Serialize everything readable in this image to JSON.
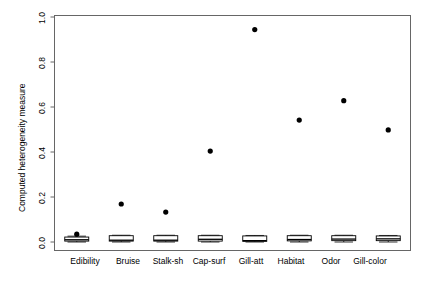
{
  "chart_data": {
    "type": "scatter",
    "title": "",
    "xlabel": "",
    "ylabel": "Computed heterogeneity measure",
    "categories": [
      "Edibility",
      "Bruise",
      "Stalk-sh",
      "Cap-surf",
      "Gill-att",
      "Habitat",
      "Odor",
      "Gill-color"
    ],
    "ylim": [
      0.0,
      1.0
    ],
    "ytick_labels": [
      "0.0",
      "0.2",
      "0.4",
      "0.6",
      "0.8",
      "1.0"
    ],
    "ytick_values": [
      0.0,
      0.2,
      0.4,
      0.6,
      0.8,
      1.0
    ],
    "grid": false,
    "legend": "none",
    "series": [
      {
        "name": "Computed heterogeneity measure",
        "marker": "filled-circle",
        "color": "#000000",
        "values": [
          0.035,
          0.169,
          0.133,
          0.404,
          0.944,
          0.542,
          0.628,
          0.498
        ]
      }
    ],
    "boxplots": [
      {
        "category": "Edibility",
        "min": 0.0,
        "q1": 0.004,
        "median": 0.01,
        "q3": 0.022,
        "max": 0.026
      },
      {
        "category": "Bruise",
        "min": 0.0,
        "q1": 0.004,
        "median": 0.008,
        "q3": 0.028,
        "max": 0.03
      },
      {
        "category": "Stalk-sh",
        "min": 0.0,
        "q1": 0.004,
        "median": 0.008,
        "q3": 0.028,
        "max": 0.03
      },
      {
        "category": "Cap-surf",
        "min": 0.0,
        "q1": 0.004,
        "median": 0.012,
        "q3": 0.028,
        "max": 0.03
      },
      {
        "category": "Gill-att",
        "min": 0.0,
        "q1": 0.003,
        "median": 0.006,
        "q3": 0.027,
        "max": 0.029
      },
      {
        "category": "Habitat",
        "min": 0.0,
        "q1": 0.005,
        "median": 0.011,
        "q3": 0.028,
        "max": 0.03
      },
      {
        "category": "Odor",
        "min": 0.0,
        "q1": 0.006,
        "median": 0.013,
        "q3": 0.028,
        "max": 0.03
      },
      {
        "category": "Gill-color",
        "min": 0.0,
        "q1": 0.006,
        "median": 0.014,
        "q3": 0.027,
        "max": 0.029
      }
    ]
  },
  "axes": {
    "y_title": "Computed heterogeneity measure",
    "y_ticks": [
      {
        "label": "1.0"
      },
      {
        "label": "0.8"
      },
      {
        "label": "0.6"
      },
      {
        "label": "0.4"
      },
      {
        "label": "0.2"
      },
      {
        "label": "0.0"
      }
    ],
    "x_ticks": [
      {
        "label": "Edibility"
      },
      {
        "label": "Bruise"
      },
      {
        "label": "Stalk-sh"
      },
      {
        "label": "Cap-surf"
      },
      {
        "label": "Gill-att"
      },
      {
        "label": "Habitat"
      },
      {
        "label": "Odor"
      },
      {
        "label": "Gill-color"
      }
    ]
  },
  "style": {
    "background": "#ffffff",
    "foreground": "#000000",
    "frame": "#555555"
  }
}
